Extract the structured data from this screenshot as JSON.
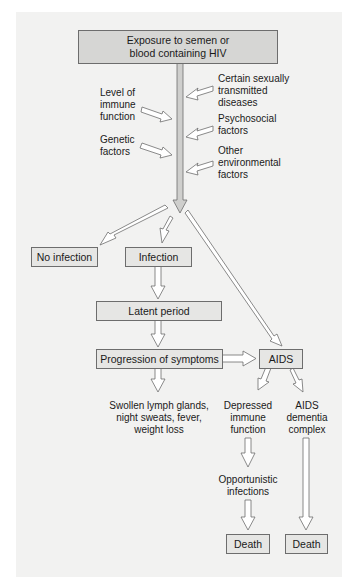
{
  "diagram": {
    "title_box": {
      "line1": "Exposure to semen or",
      "line2": "blood containing HIV"
    },
    "left_factors": [
      {
        "lines": [
          "Level of",
          "immune",
          "function"
        ]
      },
      {
        "lines": [
          "Genetic",
          "factors"
        ]
      }
    ],
    "right_factors": [
      {
        "lines": [
          "Certain sexually",
          "transmitted",
          "diseases"
        ]
      },
      {
        "lines": [
          "Psychosocial",
          "factors"
        ]
      },
      {
        "lines": [
          "Other",
          "environmental",
          "factors"
        ]
      }
    ],
    "outcomes": {
      "no_infection": "No infection",
      "infection": "Infection",
      "latent_period": "Latent period",
      "progression": "Progression of symptoms",
      "aids": "AIDS"
    },
    "symptoms": {
      "lines": [
        "Swollen lymph glands,",
        "night sweats, fever,",
        "weight loss"
      ]
    },
    "depressed_immune": {
      "lines": [
        "Depressed",
        "immune",
        "function"
      ]
    },
    "aids_dementia": {
      "lines": [
        "AIDS",
        "dementia",
        "complex"
      ]
    },
    "opportunistic": {
      "lines": [
        "Opportunistic",
        "infections"
      ]
    },
    "death_left": "Death",
    "death_right": "Death"
  },
  "colors": {
    "paper": "#f2f2f1",
    "box_fill": "#e6e6e4",
    "top_box_fill": "#d6d6d4",
    "stem_fill": "#cfcfcd",
    "line": "#6d6d6d"
  }
}
